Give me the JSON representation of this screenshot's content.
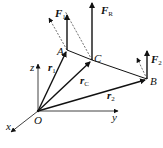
{
  "diagram": {
    "type": "vector-force-diagram",
    "points": {
      "O": {
        "label": "O",
        "x": 38,
        "y": 111
      },
      "A": {
        "label": "A",
        "x": 67,
        "y": 50
      },
      "C": {
        "label": "C",
        "x": 92,
        "y": 60
      },
      "B": {
        "label": "B",
        "x": 147,
        "y": 79
      }
    },
    "axes": {
      "x": {
        "label": "x"
      },
      "y": {
        "label": "y"
      },
      "z": {
        "label": "z"
      }
    },
    "position_vectors": {
      "r1": {
        "base": "r",
        "sub": "1"
      },
      "rC": {
        "base": "r",
        "sub": "C"
      },
      "r2": {
        "base": "r",
        "sub": "2"
      }
    },
    "forces": {
      "F1": {
        "base": "F",
        "sub": "1"
      },
      "FR": {
        "base": "F",
        "sub": "R"
      },
      "F2": {
        "base": "F",
        "sub": "2"
      }
    },
    "colors": {
      "stroke": "#111111",
      "background": "#ffffff"
    }
  }
}
